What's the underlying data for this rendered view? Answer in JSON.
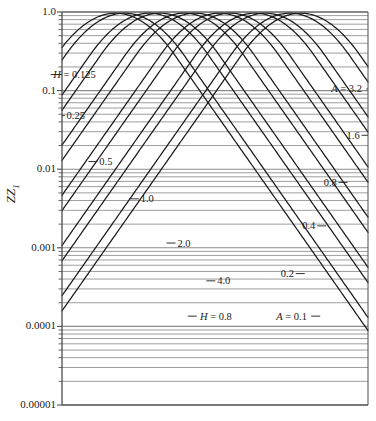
{
  "chart_data": {
    "type": "line",
    "title": "",
    "xlabel": "",
    "ylabel": "ZZ1",
    "ylabel_display": "ZZ",
    "ylabel_subscript": "1",
    "yscale": "log",
    "ylim": [
      1e-05,
      1.0
    ],
    "xlim": [
      0,
      1
    ],
    "grid": "horizontal-log-minor",
    "xaxis_ticks_visible": false,
    "ytick_labels": [
      "1.0",
      "0.1",
      "0.01",
      "0.001",
      "0.0001",
      "0.00001"
    ],
    "ytick_values": [
      1.0,
      0.1,
      0.01,
      0.001,
      0.0001,
      1e-05
    ],
    "minor_tick_multipliers": [
      2,
      3,
      4,
      5,
      6,
      7,
      8,
      9
    ],
    "legend": "none",
    "annotations": [
      {
        "text": "H = 0.125",
        "x": 0.11,
        "y_value": 0.16,
        "series": "H",
        "value": 0.125,
        "leader": "left-tick"
      },
      {
        "text": "0.25",
        "x": 0.075,
        "y_value": 0.048,
        "series": "H",
        "value": 0.25,
        "leader": "left-tick"
      },
      {
        "text": "0.5",
        "x": 0.165,
        "y_value": 0.0125,
        "series": "H",
        "value": 0.5,
        "leader": "left-tick"
      },
      {
        "text": "1.0",
        "x": 0.3,
        "y_value": 0.0042,
        "series": "H",
        "value": 1.0,
        "leader": "left-tick"
      },
      {
        "text": "2.0",
        "x": 0.42,
        "y_value": 0.00115,
        "series": "H",
        "value": 2.0,
        "leader": "left-tick"
      },
      {
        "text": "4.0",
        "x": 0.55,
        "y_value": 0.00038,
        "series": "H",
        "value": 4.0,
        "leader": "left-tick"
      },
      {
        "text": "H = 0.8",
        "x": 0.555,
        "y_value": 0.000135,
        "series": "H",
        "value": 0.8,
        "leader": "left-tick"
      },
      {
        "text": "A = 0.1",
        "x": 0.7,
        "y_value": 0.000135,
        "series": "A",
        "value": 0.1,
        "leader": "right-tick"
      },
      {
        "text": "A = 3.2",
        "x": 0.88,
        "y_value": 0.105,
        "series": "A",
        "value": 3.2,
        "leader": "right-tick"
      },
      {
        "text": "1.6",
        "x": 0.93,
        "y_value": 0.027,
        "series": "A",
        "value": 1.6,
        "leader": "right-tick"
      },
      {
        "text": "0.8",
        "x": 0.855,
        "y_value": 0.0068,
        "series": "A",
        "value": 0.8,
        "leader": "right-tick"
      },
      {
        "text": "0.4",
        "x": 0.785,
        "y_value": 0.0019,
        "series": "A",
        "value": 0.4,
        "leader": "right-tick"
      },
      {
        "text": "0.2",
        "x": 0.715,
        "y_value": 0.00047,
        "series": "A",
        "value": 0.2,
        "leader": "right-tick"
      }
    ],
    "series": [
      {
        "name": "H = 0.125",
        "family": "H",
        "value": 0.125,
        "apex_x": 0.175,
        "direction": "down-right"
      },
      {
        "name": "H = 0.25",
        "family": "H",
        "value": 0.25,
        "apex_x": 0.285,
        "direction": "down-right"
      },
      {
        "name": "H = 0.5",
        "family": "H",
        "value": 0.5,
        "apex_x": 0.4,
        "direction": "down-right"
      },
      {
        "name": "H = 1.0",
        "family": "H",
        "value": 1.0,
        "apex_x": 0.515,
        "direction": "down-right"
      },
      {
        "name": "H = 2.0",
        "family": "H",
        "value": 2.0,
        "apex_x": 0.63,
        "direction": "down-right"
      },
      {
        "name": "H = 4.0",
        "family": "H",
        "value": 4.0,
        "apex_x": 0.745,
        "direction": "down-right"
      },
      {
        "name": "A = 3.2",
        "family": "A",
        "value": 3.2,
        "apex_x": 0.78,
        "direction": "down-left"
      },
      {
        "name": "A = 1.6",
        "family": "A",
        "value": 1.6,
        "apex_x": 0.665,
        "direction": "down-left"
      },
      {
        "name": "A = 0.8",
        "family": "A",
        "value": 0.8,
        "apex_x": 0.55,
        "direction": "down-left"
      },
      {
        "name": "A = 0.4",
        "family": "A",
        "value": 0.4,
        "apex_x": 0.435,
        "direction": "down-left"
      },
      {
        "name": "A = 0.2",
        "family": "A",
        "value": 0.2,
        "apex_x": 0.32,
        "direction": "down-left"
      },
      {
        "name": "A = 0.1",
        "family": "A",
        "value": 0.1,
        "apex_x": 0.205,
        "direction": "down-left"
      }
    ],
    "colors": {
      "curve": "#1a1a1a",
      "gridline": "#8c8c8c",
      "axis": "#4d4d4d",
      "text": "#1a1a1a",
      "background": "#ffffff"
    }
  }
}
